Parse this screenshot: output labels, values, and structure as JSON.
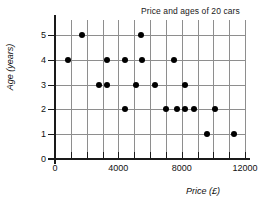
{
  "chart_data": {
    "type": "scatter",
    "title": "Price and ages of 20 cars",
    "xlabel": "Price (£)",
    "ylabel": "Age (years)",
    "xlim": [
      0,
      12000
    ],
    "ylim": [
      0,
      5.6
    ],
    "xticks": [
      0,
      4000,
      8000,
      12000
    ],
    "xtick_labels": [
      "0",
      "4000",
      "8000",
      "12000"
    ],
    "yticks": [
      0,
      1,
      2,
      3,
      4,
      5
    ],
    "ytick_labels": [
      "0",
      "1",
      "2",
      "3",
      "4",
      "5"
    ],
    "grid": true,
    "grid_x_step": 1000,
    "grid_y_step": 1,
    "grid_color": "#8e8e8e",
    "marker_color": "#000000",
    "legend": null,
    "points": [
      {
        "price": 1700,
        "age": 5
      },
      {
        "price": 5400,
        "age": 5
      },
      {
        "price": 800,
        "age": 4
      },
      {
        "price": 3300,
        "age": 4
      },
      {
        "price": 4400,
        "age": 4
      },
      {
        "price": 5500,
        "age": 4
      },
      {
        "price": 7500,
        "age": 4
      },
      {
        "price": 2800,
        "age": 3
      },
      {
        "price": 3300,
        "age": 3
      },
      {
        "price": 5100,
        "age": 3
      },
      {
        "price": 6300,
        "age": 3
      },
      {
        "price": 8200,
        "age": 3
      },
      {
        "price": 4400,
        "age": 2
      },
      {
        "price": 7000,
        "age": 2
      },
      {
        "price": 7700,
        "age": 2
      },
      {
        "price": 8200,
        "age": 2
      },
      {
        "price": 8800,
        "age": 2
      },
      {
        "price": 10100,
        "age": 2
      },
      {
        "price": 9600,
        "age": 1
      },
      {
        "price": 11300,
        "age": 1
      }
    ]
  }
}
